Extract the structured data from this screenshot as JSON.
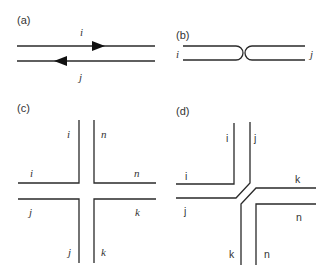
{
  "panels": {
    "a": {
      "label": "(a)",
      "top_line_label": "i",
      "bottom_line_label": "j"
    },
    "b": {
      "label": "(b)",
      "left_label": "i",
      "right_label": "j"
    },
    "c": {
      "label": "(c)",
      "labels": {
        "i_top": "i",
        "n_top": "n",
        "i_left": "i",
        "n_right": "n",
        "j_left": "j",
        "k_right": "k",
        "j_bottom": "j",
        "k_bottom": "k"
      }
    },
    "d": {
      "label": "(d)",
      "labels": {
        "i_top": "i",
        "j_top": "j",
        "i_left": "i",
        "k_right": "k",
        "j_left": "j",
        "n_right": "n",
        "k_bottom": "k",
        "n_bottom": "n"
      }
    }
  },
  "colors": {
    "line": "#2a2a2a",
    "text": "#333333",
    "background": "#ffffff"
  }
}
